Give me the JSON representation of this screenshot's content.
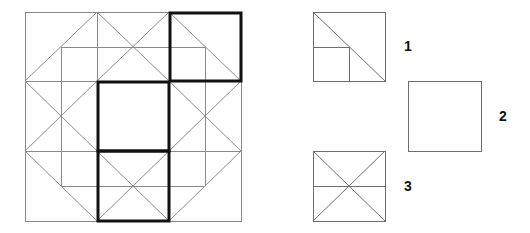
{
  "diagram": {
    "main_figure": {
      "description": "3x3 square grid with inner square and diagonal ring pattern; three highlighted (bold) cells",
      "outer_square": {
        "x": 25,
        "y": 12,
        "w": 216,
        "h": 209
      },
      "grid_x": [
        25,
        97,
        169,
        241
      ],
      "grid_y": [
        12,
        81,
        151,
        221
      ],
      "inner_lines": [
        [
          61,
          47,
          61,
          186
        ],
        [
          205,
          47,
          205,
          186
        ],
        [
          61,
          47,
          205,
          47
        ],
        [
          61,
          186,
          205,
          186
        ]
      ],
      "diagonals": [
        [
          25,
          81,
          97,
          12
        ],
        [
          97,
          12,
          169,
          81
        ],
        [
          169,
          12,
          97,
          81
        ],
        [
          169,
          12,
          241,
          81
        ],
        [
          25,
          81,
          97,
          151
        ],
        [
          97,
          81,
          25,
          151
        ],
        [
          169,
          81,
          241,
          151
        ],
        [
          241,
          81,
          169,
          151
        ],
        [
          25,
          151,
          97,
          221
        ],
        [
          97,
          151,
          169,
          221
        ],
        [
          169,
          151,
          97,
          221
        ],
        [
          241,
          151,
          169,
          221
        ]
      ],
      "highlighted_cells": [
        {
          "name": "top-right",
          "x": 169,
          "y": 12,
          "w": 72,
          "h": 69
        },
        {
          "name": "middle-center",
          "x": 97,
          "y": 81,
          "w": 72,
          "h": 70
        },
        {
          "name": "bottom-center",
          "x": 97,
          "y": 151,
          "w": 72,
          "h": 70
        }
      ]
    },
    "options": [
      {
        "label": "1",
        "box": {
          "x": 313,
          "y": 12,
          "w": 72,
          "h": 69
        },
        "label_pos": {
          "x": 404,
          "y": 39
        },
        "content": "diagonal from top-left to bottom-right with small square in bottom-left quadrant"
      },
      {
        "label": "2",
        "box": {
          "x": 408,
          "y": 81,
          "w": 73,
          "h": 70
        },
        "label_pos": {
          "x": 499,
          "y": 109
        },
        "content": "empty square"
      },
      {
        "label": "3",
        "box": {
          "x": 313,
          "y": 151,
          "w": 72,
          "h": 70
        },
        "label_pos": {
          "x": 404,
          "y": 179
        },
        "content": "X diagonals with horizontal midline"
      }
    ]
  }
}
